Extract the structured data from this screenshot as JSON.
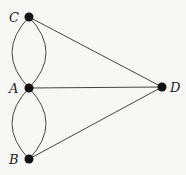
{
  "diagram": {
    "type": "multigraph",
    "nodes": [
      {
        "id": "C",
        "label": "C",
        "x": 29,
        "y": 17
      },
      {
        "id": "A",
        "label": "A",
        "x": 29,
        "y": 88
      },
      {
        "id": "B",
        "label": "B",
        "x": 29,
        "y": 159
      },
      {
        "id": "D",
        "label": "D",
        "x": 162,
        "y": 87
      }
    ],
    "edges": [
      {
        "from": "C",
        "to": "A",
        "shape": "curve-left"
      },
      {
        "from": "C",
        "to": "A",
        "shape": "curve-right"
      },
      {
        "from": "A",
        "to": "B",
        "shape": "curve-left"
      },
      {
        "from": "A",
        "to": "B",
        "shape": "curve-right"
      },
      {
        "from": "C",
        "to": "D",
        "shape": "straight"
      },
      {
        "from": "A",
        "to": "D",
        "shape": "straight"
      },
      {
        "from": "B",
        "to": "D",
        "shape": "straight"
      }
    ],
    "colors": {
      "node": "#111111",
      "edge": "#444444",
      "background": "#f7f7f5"
    }
  }
}
